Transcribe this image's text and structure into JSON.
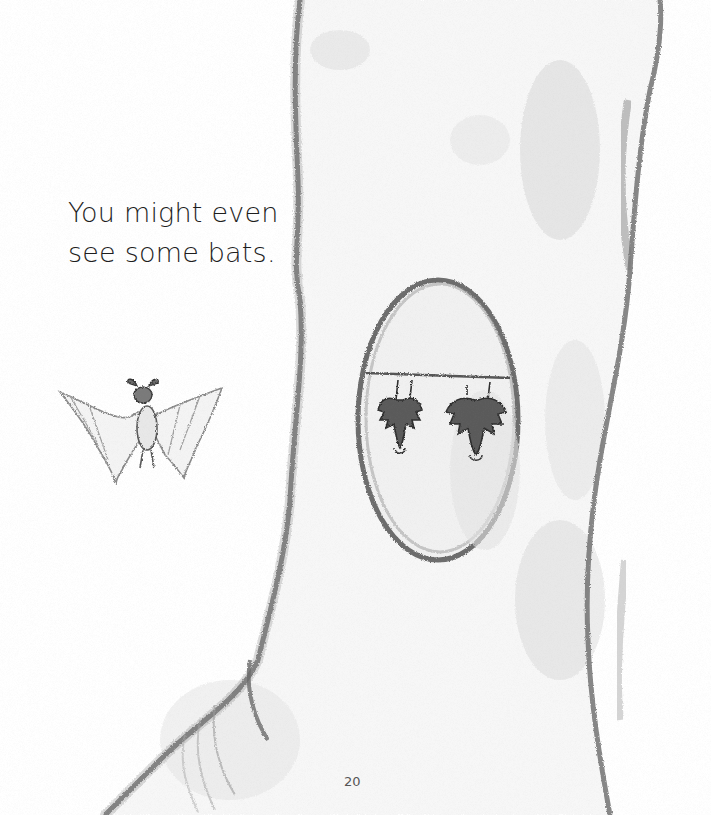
{
  "page": {
    "text_lines": [
      "You might even",
      "see some bats."
    ],
    "page_number": "20"
  },
  "illustration": {
    "elements": [
      "tree-trunk",
      "tree-hollow",
      "hanging-bat-left",
      "hanging-bat-right",
      "flying-bat"
    ],
    "colors": {
      "pencil_dark": "#3a3a3a",
      "pencil_mid": "#6e6e6e",
      "pencil_light": "#b5b5b5",
      "paper": "#ffffff"
    }
  }
}
